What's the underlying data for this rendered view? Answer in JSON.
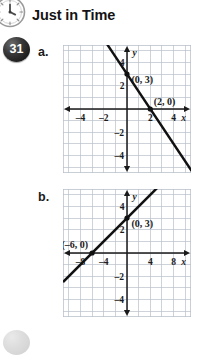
{
  "header": {
    "title": "Just in Time",
    "icon": "clock-icon"
  },
  "problem": {
    "number": "31",
    "parts": [
      {
        "label": "a."
      },
      {
        "label": "b."
      }
    ]
  },
  "chart_data": [
    {
      "id": "graph-a",
      "type": "line",
      "title": "",
      "xlabel": "x",
      "ylabel": "y",
      "xlim": [
        -5.5,
        5.5
      ],
      "ylim": [
        -5.5,
        5.5
      ],
      "grid": true,
      "grid_step": 1,
      "xticks": [
        -4,
        -2,
        2,
        4
      ],
      "xticklabels": [
        "-4",
        "-2",
        "2",
        "4"
      ],
      "yticks": [
        -4,
        -2,
        2,
        4
      ],
      "yticklabels": [
        "-4",
        "-2",
        "2",
        "4"
      ],
      "axis_arrow_labels": {
        "x": "x",
        "y": "y"
      },
      "series": [
        {
          "name": "line-a",
          "slope": -1.5,
          "intercept": 3,
          "points": [
            [
              -1.7,
              5.55
            ],
            [
              5.55,
              -5.32
            ]
          ]
        }
      ],
      "annotations": [
        {
          "text": "(0, 3)",
          "x": 0,
          "y": 3,
          "plotted_point": true
        },
        {
          "text": "(2, 0)",
          "x": 2,
          "y": 0,
          "plotted_point": true
        }
      ]
    },
    {
      "id": "graph-b",
      "type": "line",
      "title": "",
      "xlabel": "x",
      "ylabel": "y",
      "xlim": [
        -11,
        11
      ],
      "ylim": [
        -5.5,
        5.5
      ],
      "grid": true,
      "grid_step_x": 2,
      "grid_step_y": 1,
      "xticks": [
        -8,
        -4,
        4,
        8
      ],
      "xticklabels": [
        "-8",
        "-4",
        "4",
        "8"
      ],
      "yticks": [
        -4,
        -2,
        2,
        4
      ],
      "yticklabels": [
        "-4",
        "-2",
        "2",
        "4"
      ],
      "axis_arrow_labels": {
        "x": "x",
        "y": "y"
      },
      "series": [
        {
          "name": "line-b",
          "slope": 0.5,
          "intercept": 3,
          "points": [
            [
              -11,
              -2.5
            ],
            [
              5.2,
              5.6
            ]
          ]
        }
      ],
      "annotations": [
        {
          "text": "(0, 3)",
          "x": 0,
          "y": 3,
          "plotted_point": true
        },
        {
          "text": "(–6, 0)",
          "x": -6,
          "y": 0,
          "plotted_point": true
        }
      ]
    }
  ],
  "colors": {
    "grid": "#b9bfc9",
    "axis": "#1a1a1a",
    "line": "#111111",
    "badge": "#1b1b1b",
    "text": "#141414"
  }
}
